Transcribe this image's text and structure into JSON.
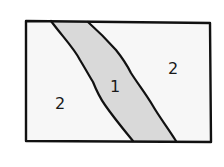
{
  "diagram": {
    "colors": {
      "background": "#ffffff",
      "region_fill": "#f7f7f7",
      "band_fill": "#d9d9d9",
      "stroke": "#111111"
    },
    "regions": [
      {
        "id": "left-region",
        "label": "2"
      },
      {
        "id": "band-region",
        "label": "1"
      },
      {
        "id": "right-region",
        "label": "2"
      }
    ]
  }
}
